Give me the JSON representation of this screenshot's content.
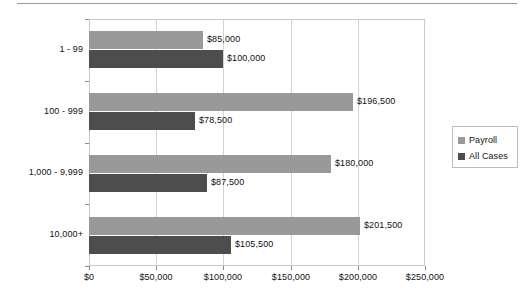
{
  "chart_data": {
    "type": "bar",
    "orientation": "horizontal",
    "title": "",
    "xlabel": "",
    "ylabel": "",
    "categories": [
      "1 - 99",
      "100 - 999",
      "1,000 - 9,999",
      "10,000+"
    ],
    "series": [
      {
        "name": "Payroll",
        "color": "#999999",
        "values": [
          85000,
          196500,
          180000,
          201500
        ],
        "labels": [
          "$85,000",
          "$196,500",
          "$180,000",
          "$201,500"
        ]
      },
      {
        "name": "All Cases",
        "color": "#4d4d4d",
        "values": [
          100000,
          78500,
          87500,
          105500
        ],
        "labels": [
          "$100,000",
          "$78,500",
          "$87,500",
          "$105,500"
        ]
      }
    ],
    "xlim": [
      0,
      250000
    ],
    "xticks": [
      0,
      50000,
      100000,
      150000,
      200000,
      250000
    ],
    "xticklabels": [
      "$0",
      "$50,000",
      "$100,000",
      "$150,000",
      "$200,000",
      "$250,000"
    ],
    "grid": true,
    "grid_axis": "x",
    "legend_position": "right"
  },
  "legend": {
    "entries": [
      {
        "label": "Payroll",
        "swatch": "legend-swatch-payroll"
      },
      {
        "label": "All Cases",
        "swatch": "legend-swatch-all-cases"
      }
    ]
  }
}
